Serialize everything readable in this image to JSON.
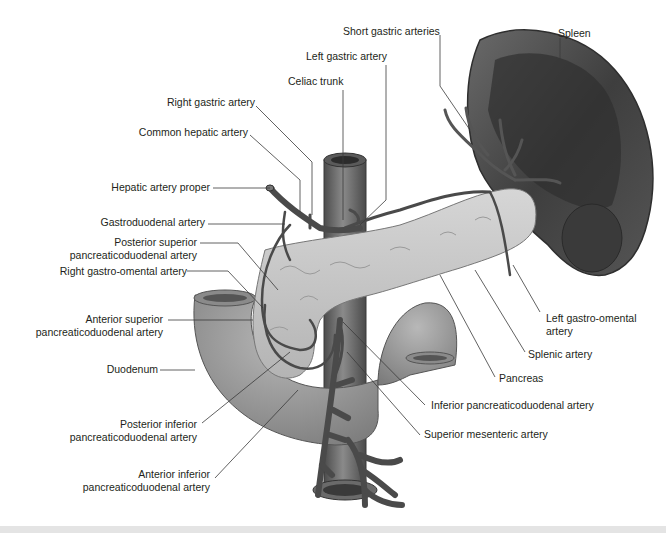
{
  "figure": {
    "colors": {
      "background": "#ffffff",
      "label_text": "#231f20",
      "leader_line": "#3a3a3a",
      "spleen": "#4a4a4a",
      "pancreas": "#c9c9c9",
      "duodenum": "#9a9a9a",
      "artery": "#5a5a5a",
      "aorta": "#6e6e6e"
    },
    "labels": {
      "short_gastric": "Short gastric arteries",
      "spleen": "Spleen",
      "left_gastric": "Left gastric artery",
      "celiac_trunk": "Celiac trunk",
      "right_gastric": "Right gastric artery",
      "common_hepatic": "Common hepatic artery",
      "hepatic_proper": "Hepatic artery proper",
      "gastroduodenal": "Gastroduodenal artery",
      "post_sup_pd_1": "Posterior superior",
      "post_sup_pd_2": "pancreaticoduodenal artery",
      "right_gastro_omental": "Right gastro-omental artery",
      "ant_sup_pd_1": "Anterior superior",
      "ant_sup_pd_2": "pancreaticoduodenal artery",
      "duodenum": "Duodenum",
      "post_inf_pd_1": "Posterior inferior",
      "post_inf_pd_2": "pancreaticoduodenal artery",
      "ant_inf_pd_1": "Anterior inferior",
      "ant_inf_pd_2": "pancreaticoduodenal artery",
      "left_gastro_omental_1": "Left gastro-omental",
      "left_gastro_omental_2": "artery",
      "splenic_artery": "Splenic artery",
      "pancreas": "Pancreas",
      "inferior_pd": "Inferior pancreaticoduodenal artery",
      "superior_mesenteric": "Superior mesenteric artery"
    }
  }
}
